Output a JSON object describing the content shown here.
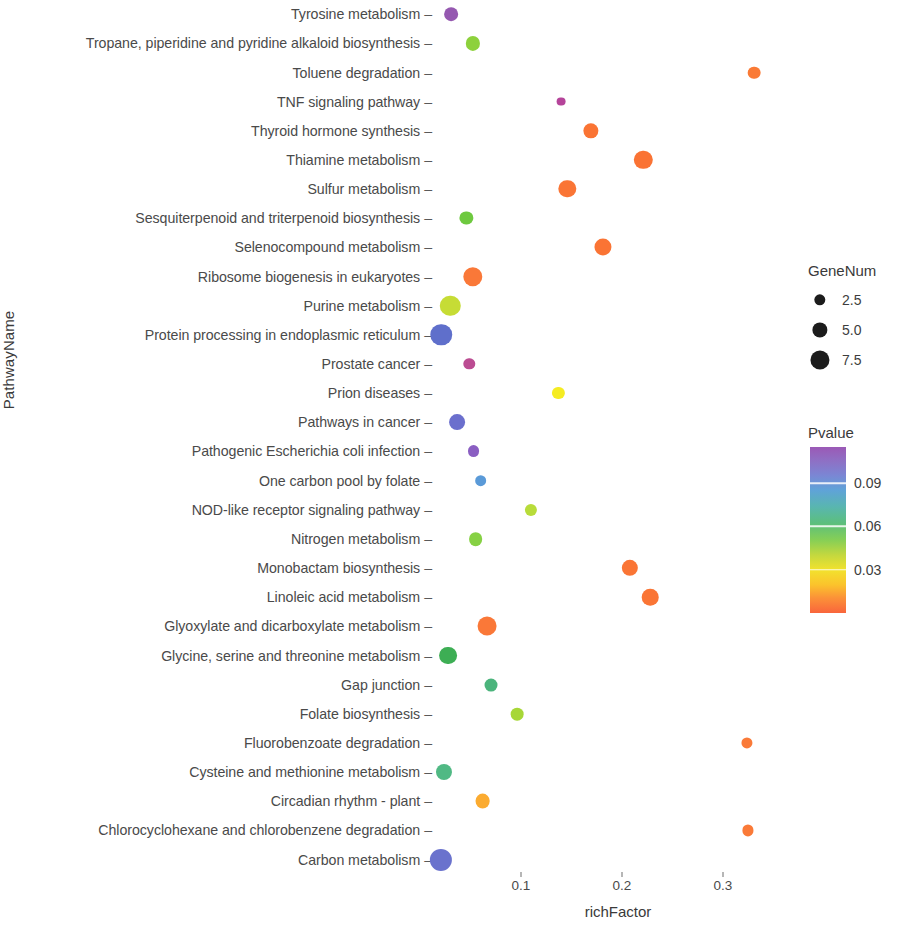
{
  "chart_data": {
    "type": "scatter",
    "title": "",
    "xlabel": "richFactor",
    "ylabel": "PathwayName",
    "xlim": [
      0.0,
      0.36
    ],
    "ylim_categories": 29,
    "grid": false,
    "xticks": [
      0.1,
      0.2,
      0.3
    ],
    "xtick_labels": [
      "0.1",
      "0.2",
      "0.3"
    ],
    "categories": [
      "Tyrosine metabolism",
      "Tropane, piperidine and pyridine alkaloid biosynthesis",
      "Toluene degradation",
      "TNF signaling pathway",
      "Thyroid hormone synthesis",
      "Thiamine metabolism",
      "Sulfur metabolism",
      "Sesquiterpenoid and triterpenoid biosynthesis",
      "Selenocompound metabolism",
      "Ribosome biogenesis in eukaryotes",
      "Purine metabolism",
      "Protein processing in endoplasmic reticulum",
      "Prostate cancer",
      "Prion diseases",
      "Pathways in cancer",
      "Pathogenic Escherichia coli infection",
      "One carbon pool by folate",
      "NOD-like receptor signaling pathway",
      "Nitrogen metabolism",
      "Monobactam biosynthesis",
      "Linoleic acid metabolism",
      "Glyoxylate and dicarboxylate metabolism",
      "Glycine, serine and threonine metabolism",
      "Gap junction",
      "Folate biosynthesis",
      "Fluorobenzoate degradation",
      "Cysteine and methionine metabolism",
      "Circadian rhythm - plant",
      "Chlorocyclohexane and chlorobenzene degradation",
      "Carbon metabolism"
    ],
    "points": [
      {
        "pathway": "Tyrosine metabolism",
        "richFactor": 0.031,
        "GeneNum": 3.0,
        "Pvalue": 0.108,
        "color": "#9558b0"
      },
      {
        "pathway": "Tropane, piperidine and pyridine alkaloid biosynthesis",
        "richFactor": 0.052,
        "GeneNum": 3.2,
        "Pvalue": 0.049,
        "color": "#8dd13c"
      },
      {
        "pathway": "Toluene degradation",
        "richFactor": 0.331,
        "GeneNum": 2.6,
        "Pvalue": 0.012,
        "color": "#fa7a35"
      },
      {
        "pathway": "TNF signaling pathway",
        "richFactor": 0.14,
        "GeneNum": 1.1,
        "Pvalue": 0.101,
        "color": "#b5449a"
      },
      {
        "pathway": "Thyroid hormone synthesis",
        "richFactor": 0.169,
        "GeneNum": 3.6,
        "Pvalue": 0.013,
        "color": "#fa7434"
      },
      {
        "pathway": "Thiamine metabolism",
        "richFactor": 0.221,
        "GeneNum": 4.8,
        "Pvalue": 0.011,
        "color": "#fa7334"
      },
      {
        "pathway": "Sulfur metabolism",
        "richFactor": 0.146,
        "GeneNum": 4.4,
        "Pvalue": 0.012,
        "color": "#fa7535"
      },
      {
        "pathway": "Sesquiterpenoid and triterpenoid biosynthesis",
        "richFactor": 0.046,
        "GeneNum": 2.8,
        "Pvalue": 0.054,
        "color": "#6ec93f"
      },
      {
        "pathway": "Selenocompound metabolism",
        "richFactor": 0.181,
        "GeneNum": 4.3,
        "Pvalue": 0.012,
        "color": "#fa7434"
      },
      {
        "pathway": "Ribosome biogenesis in eukaryotes",
        "richFactor": 0.052,
        "GeneNum": 5.2,
        "Pvalue": 0.014,
        "color": "#fa7838"
      },
      {
        "pathway": "Purine metabolism",
        "richFactor": 0.03,
        "GeneNum": 5.6,
        "Pvalue": 0.036,
        "color": "#c6dc35"
      },
      {
        "pathway": "Protein processing in endoplasmic reticulum",
        "richFactor": 0.021,
        "GeneNum": 6.0,
        "Pvalue": 0.085,
        "color": "#5f6fcb"
      },
      {
        "pathway": "Prostate cancer",
        "richFactor": 0.049,
        "GeneNum": 2.1,
        "Pvalue": 0.102,
        "color": "#bb4c92"
      },
      {
        "pathway": "Prion diseases",
        "richFactor": 0.137,
        "GeneNum": 2.4,
        "Pvalue": 0.031,
        "color": "#f5ec22"
      },
      {
        "pathway": "Pathways in cancer",
        "richFactor": 0.037,
        "GeneNum": 3.8,
        "Pvalue": 0.092,
        "color": "#6b6fcd"
      },
      {
        "pathway": "Pathogenic Escherichia coli infection",
        "richFactor": 0.053,
        "GeneNum": 2.3,
        "Pvalue": 0.104,
        "color": "#8a5ec2"
      },
      {
        "pathway": "One carbon pool by folate",
        "richFactor": 0.06,
        "GeneNum": 2.2,
        "Pvalue": 0.077,
        "color": "#5a9ad8"
      },
      {
        "pathway": "NOD-like receptor signaling pathway",
        "richFactor": 0.11,
        "GeneNum": 2.4,
        "Pvalue": 0.04,
        "color": "#b8dc3a"
      },
      {
        "pathway": "Nitrogen metabolism",
        "richFactor": 0.055,
        "GeneNum": 3.0,
        "Pvalue": 0.047,
        "color": "#86d144"
      },
      {
        "pathway": "Monobactam biosynthesis",
        "richFactor": 0.208,
        "GeneNum": 4.0,
        "Pvalue": 0.013,
        "color": "#fa7535"
      },
      {
        "pathway": "Linoleic acid metabolism",
        "richFactor": 0.228,
        "GeneNum": 4.1,
        "Pvalue": 0.013,
        "color": "#fa7535"
      },
      {
        "pathway": "Glyoxylate and dicarboxylate metabolism",
        "richFactor": 0.066,
        "GeneNum": 5.0,
        "Pvalue": 0.014,
        "color": "#fa7838"
      },
      {
        "pathway": "Glycine, serine and threonine metabolism",
        "richFactor": 0.028,
        "GeneNum": 4.6,
        "Pvalue": 0.06,
        "color": "#3dae54"
      },
      {
        "pathway": "Gap junction",
        "richFactor": 0.07,
        "GeneNum": 2.7,
        "Pvalue": 0.062,
        "color": "#4bb47c"
      },
      {
        "pathway": "Folate biosynthesis",
        "richFactor": 0.096,
        "GeneNum": 2.6,
        "Pvalue": 0.042,
        "color": "#a7d737"
      },
      {
        "pathway": "Fluorobenzoate degradation",
        "richFactor": 0.324,
        "GeneNum": 2.0,
        "Pvalue": 0.013,
        "color": "#fa7a38"
      },
      {
        "pathway": "Cysteine and methionine metabolism",
        "richFactor": 0.024,
        "GeneNum": 3.9,
        "Pvalue": 0.063,
        "color": "#50b984"
      },
      {
        "pathway": "Circadian rhythm - plant",
        "richFactor": 0.062,
        "GeneNum": 3.4,
        "Pvalue": 0.023,
        "color": "#fbab30"
      },
      {
        "pathway": "Chlorocyclohexane and chlorobenzene degradation",
        "richFactor": 0.325,
        "GeneNum": 2.0,
        "Pvalue": 0.013,
        "color": "#fa7a38"
      },
      {
        "pathway": "Carbon metabolism",
        "richFactor": 0.021,
        "GeneNum": 6.3,
        "Pvalue": 0.09,
        "color": "#6a72cd"
      }
    ],
    "legends": {
      "size": {
        "title": "GeneNum",
        "entries": [
          {
            "label": "2.5",
            "value": 2.5
          },
          {
            "label": "5.0",
            "value": 5.0
          },
          {
            "label": "7.5",
            "value": 7.5
          }
        ]
      },
      "color": {
        "title": "Pvalue",
        "ticks": [
          {
            "label": "0.09",
            "value": 0.09
          },
          {
            "label": "0.06",
            "value": 0.06
          },
          {
            "label": "0.03",
            "value": 0.03
          }
        ],
        "range": [
          0.0,
          0.115
        ],
        "gradient_top": "#9b59b6",
        "gradient_bottom": "#f9653c",
        "orientation": "vertical-descending"
      }
    }
  }
}
